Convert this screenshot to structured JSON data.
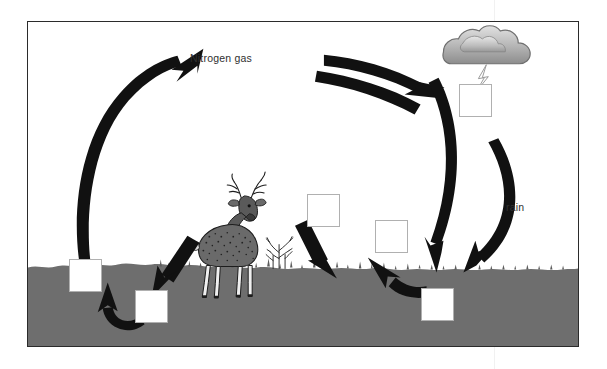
{
  "diagram": {
    "frame": {
      "border_color": "#2b2b2b"
    },
    "colors": {
      "soil": "#6e6e6e",
      "soil_dark": "#5f5f5f",
      "arrow": "#111111",
      "box_border": "#b0b0b0",
      "box_fill": "#ffffff",
      "cloud_light": "#d8d8d8",
      "cloud_dark": "#8a8a8a",
      "text": "#2f2f2f"
    },
    "labels": [
      {
        "id": "nitrogen-gas",
        "text": "Nitrogen gas",
        "x": 190,
        "y": 52
      },
      {
        "id": "rain",
        "text": "rain",
        "x": 506,
        "y": 201
      }
    ],
    "blank_boxes": [
      {
        "id": "box-atmospheric-fixation",
        "x": 458,
        "y": 83,
        "w": 33,
        "h": 33
      },
      {
        "id": "box-plant-uptake",
        "x": 306,
        "y": 193,
        "w": 33,
        "h": 33
      },
      {
        "id": "box-nitrification",
        "x": 374,
        "y": 219,
        "w": 33,
        "h": 33
      },
      {
        "id": "box-denitrification",
        "x": 68,
        "y": 258,
        "w": 33,
        "h": 33
      },
      {
        "id": "box-soil-bacteria",
        "x": 134,
        "y": 289,
        "w": 33,
        "h": 33
      },
      {
        "id": "box-soil-nitrogen",
        "x": 420,
        "y": 287,
        "w": 33,
        "h": 33
      }
    ],
    "elements": {
      "cloud": "cloud-icon",
      "lightning": "lightning-bolt-icon",
      "deer": "deer-illustration",
      "shrub": "shrub-illustration",
      "soil": "soil-layer"
    },
    "arrows": [
      {
        "id": "arrow-soil-to-atmosphere",
        "kind": "arc",
        "direction": "up-right"
      },
      {
        "id": "arrow-atmosphere-to-cloud-upper",
        "kind": "arc",
        "direction": "right"
      },
      {
        "id": "arrow-atmosphere-to-cloud-lower",
        "kind": "arc",
        "direction": "right"
      },
      {
        "id": "arrow-fixation-down-to-soil",
        "kind": "arc",
        "direction": "down"
      },
      {
        "id": "arrow-rain-down-to-soil",
        "kind": "arc",
        "direction": "down"
      },
      {
        "id": "arrow-animal-waste-to-soil",
        "kind": "straight",
        "direction": "down-left"
      },
      {
        "id": "arrow-plant-decay-to-soil",
        "kind": "straight",
        "direction": "down-right"
      },
      {
        "id": "arrow-soil-to-plant-uptake",
        "kind": "arc",
        "direction": "up-left"
      },
      {
        "id": "arrow-soil-bacteria-loop",
        "kind": "arc",
        "direction": "up-left"
      }
    ]
  }
}
